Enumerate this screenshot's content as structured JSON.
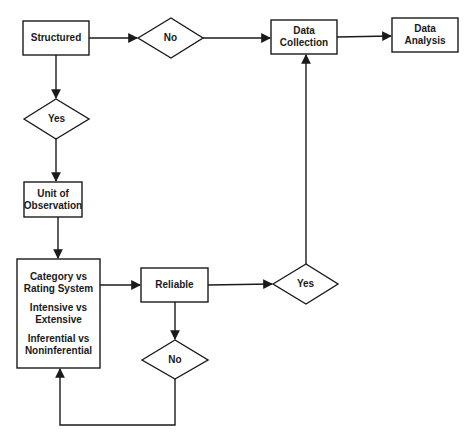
{
  "diagram": {
    "type": "flowchart",
    "colors": {
      "stroke": "#1a1a1a",
      "background": "#ffffff",
      "text": "#1a1a1a"
    },
    "nodes": {
      "structured": {
        "shape": "rect",
        "label": "Structured"
      },
      "no_top": {
        "shape": "diamond",
        "label": "No"
      },
      "data_collection": {
        "shape": "rect",
        "label_line1": "Data",
        "label_line2": "Collection"
      },
      "data_analysis": {
        "shape": "rect",
        "label_line1": "Data",
        "label_line2": "Analysis"
      },
      "yes_left": {
        "shape": "diamond",
        "label": "Yes"
      },
      "unit_of_observation": {
        "shape": "rect",
        "label_line1": "Unit of",
        "label_line2": "Observation"
      },
      "classification": {
        "shape": "rect",
        "items": [
          {
            "line1": "Category vs",
            "line2": "Rating System"
          },
          {
            "line1": "Intensive vs",
            "line2": "Extensive"
          },
          {
            "line1": "Inferential vs",
            "line2": "Noninferential"
          }
        ]
      },
      "reliable": {
        "shape": "rect",
        "label": "Reliable"
      },
      "yes_right": {
        "shape": "diamond",
        "label": "Yes"
      },
      "no_bottom": {
        "shape": "diamond",
        "label": "No"
      }
    },
    "edges": [
      {
        "from": "Structured",
        "to": "No"
      },
      {
        "from": "No",
        "to": "Data Collection"
      },
      {
        "from": "Data Collection",
        "to": "Data Analysis"
      },
      {
        "from": "Structured",
        "to": "Yes"
      },
      {
        "from": "Yes",
        "to": "Unit of Observation"
      },
      {
        "from": "Unit of Observation",
        "to": "Category vs Rating System / Intensive vs Extensive / Inferential vs Noninferential"
      },
      {
        "from": "Category vs Rating System / Intensive vs Extensive / Inferential vs Noninferential",
        "to": "Reliable"
      },
      {
        "from": "Reliable",
        "to": "Yes"
      },
      {
        "from": "Yes",
        "to": "Data Collection"
      },
      {
        "from": "Reliable",
        "to": "No"
      },
      {
        "from": "No",
        "to": "Category vs Rating System / Intensive vs Extensive / Inferential vs Noninferential"
      }
    ]
  }
}
